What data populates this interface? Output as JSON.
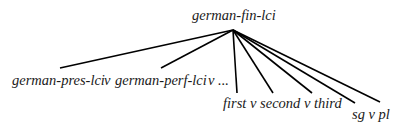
{
  "diagram": {
    "type": "tree",
    "root": {
      "label": "german-fin-lci",
      "apex": [
        233,
        30
      ]
    },
    "groups": [
      {
        "id": "tense",
        "text": "german-pres-lci   v  german-perf-lci   v  ...",
        "parts": [
          "german-pres-lci",
          "v",
          "german-perf-lci",
          "v ..."
        ]
      },
      {
        "id": "person",
        "text": "first v second v third"
      },
      {
        "id": "number",
        "text": "sg v pl"
      }
    ],
    "edges": [
      {
        "to": [
          60,
          68
        ],
        "group": "tense"
      },
      {
        "to": [
          161,
          68
        ],
        "group": "tense"
      },
      {
        "to": [
          237,
          93
        ],
        "group": "person"
      },
      {
        "to": [
          273,
          93
        ],
        "group": "person"
      },
      {
        "to": [
          312,
          93
        ],
        "group": "person"
      },
      {
        "to": [
          355,
          103
        ],
        "group": "number"
      },
      {
        "to": [
          380,
          102
        ],
        "group": "number"
      }
    ],
    "line_color": "#000000"
  }
}
